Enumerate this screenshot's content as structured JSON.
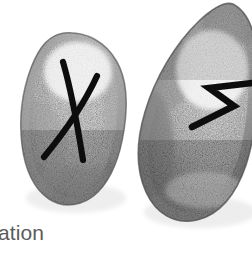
{
  "scene": {
    "title": "Two hand-drawn rune stones",
    "medium": "pencil / graphite shaded drawing",
    "background_color": "#ffffff",
    "width": 252,
    "height": 254
  },
  "stones": [
    {
      "id": "stone-left",
      "rune_name": "Gebo",
      "rune_glyph": "X",
      "rune_meaning_label": "gift",
      "shape": "elongated rounded oval, tilted slightly clockwise",
      "stroke_color": "#101010",
      "body_light_color": "#fbfbfb",
      "body_mid_color": "#d8d8d8",
      "body_shadow_color": "#8d8d8d",
      "outline_color": "#5a5a5a",
      "cropped": false
    },
    {
      "id": "stone-right",
      "rune_name": "Sowilo",
      "rune_glyph": "S",
      "rune_meaning_label": "sun",
      "shape": "teardrop / egg shape, wide rounded base",
      "stroke_color": "#0c0c0c",
      "body_light_color": "#fcfcfc",
      "body_mid_color": "#d2d2d2",
      "body_shadow_color": "#787878",
      "outline_color": "#4f4f4f",
      "cropped": true,
      "crop_edge": "right"
    }
  ],
  "caption": {
    "text": "ation",
    "full_text_visible": "ation",
    "color": "#5b5b5b",
    "cropped": true,
    "crop_edge": "left"
  }
}
